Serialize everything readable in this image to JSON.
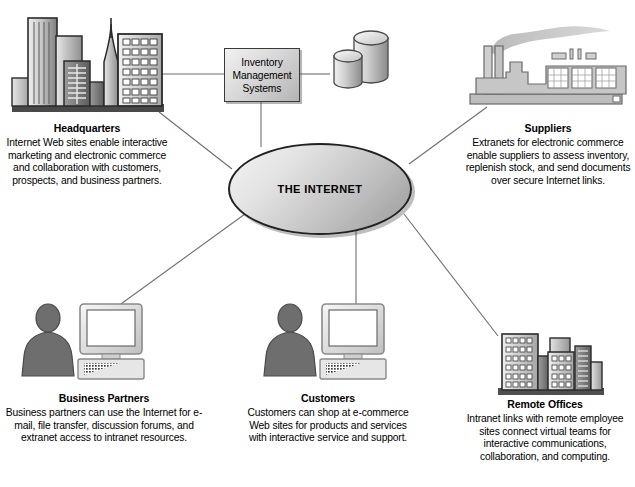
{
  "diagram": {
    "center": {
      "label": "THE INTERNET"
    },
    "ims": {
      "label": "Inventory\nManagement\nSystems",
      "line1": "Inventory",
      "line2": "Management",
      "line3": "Systems"
    },
    "nodes": [
      {
        "id": "headquarters",
        "icon": "city-skyline-icon",
        "title": "Headquarters",
        "body": "Internet Web sites enable interactive marketing and electronic commerce and collaboration with customers, prospects, and business partners."
      },
      {
        "id": "suppliers",
        "icon": "factory-icon",
        "title": "Suppliers",
        "body": "Extranets for electronic commerce enable suppliers to assess inventory, replenish stock, and send documents over secure Internet links."
      },
      {
        "id": "business-partners",
        "icon": "person-computer-icon",
        "title": "Business Partners",
        "body": "Business partners can use the Internet for e-mail, file transfer, discussion forums, and extranet access to intranet resources."
      },
      {
        "id": "customers",
        "icon": "person-computer-icon",
        "title": "Customers",
        "body": "Customers can shop at e-commerce Web sites for products and services with interactive service and support."
      },
      {
        "id": "remote-offices",
        "icon": "office-buildings-icon",
        "title": "Remote Offices",
        "body": "Intranet links with remote employee sites connect virtual teams for interactive communications, collaboration, and computing."
      }
    ],
    "database": {
      "icon": "database-cylinders-icon"
    },
    "colors": {
      "line": "#6e6e6e",
      "text": "#000000",
      "icon_dark": "#4a4a4a",
      "icon_mid": "#8e8e8e",
      "icon_light": "#d5d5d5",
      "outline": "#2b2b2b",
      "background": "#ffffff"
    }
  }
}
